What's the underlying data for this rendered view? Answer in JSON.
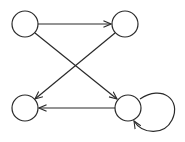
{
  "diagram": {
    "type": "directed-graph",
    "stroke": "#2a2a2a",
    "nodes": [
      {
        "id": "top-left",
        "label": ""
      },
      {
        "id": "top-right",
        "label": ""
      },
      {
        "id": "bottom-left",
        "label": ""
      },
      {
        "id": "bottom-right",
        "label": ""
      }
    ],
    "edges": [
      {
        "from": "top-left",
        "to": "top-right"
      },
      {
        "from": "top-left",
        "to": "bottom-right"
      },
      {
        "from": "top-right",
        "to": "bottom-left"
      },
      {
        "from": "bottom-right",
        "to": "bottom-left"
      },
      {
        "from": "bottom-right",
        "to": "bottom-right"
      }
    ]
  }
}
